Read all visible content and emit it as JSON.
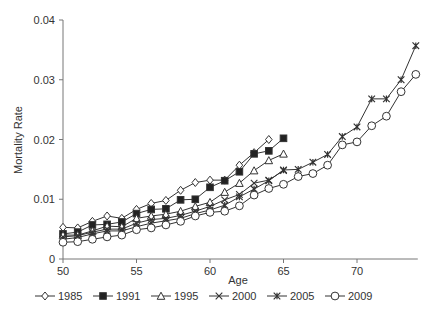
{
  "chart_data": {
    "type": "line",
    "title": "",
    "xlabel": "Age",
    "ylabel": "Mortality Rate",
    "xlim": [
      50,
      74
    ],
    "ylim": [
      0,
      0.04
    ],
    "x_ticks": [
      50,
      55,
      60,
      65,
      70
    ],
    "y_ticks": [
      0,
      0.01,
      0.02,
      0.03,
      0.04
    ],
    "y_tick_labels": [
      "0",
      "0.01",
      "0.02",
      "0.03",
      "0.04"
    ],
    "grid": false,
    "legend_position": "bottom",
    "series": [
      {
        "name": "1985",
        "marker": "diamond-open",
        "start_age": 50,
        "values": [
          0.0053,
          0.0052,
          0.0063,
          0.0072,
          0.0068,
          0.0083,
          0.0093,
          0.0098,
          0.0115,
          0.0128,
          0.0132,
          0.0132,
          0.0157,
          0.0178,
          0.02
        ]
      },
      {
        "name": "1991",
        "marker": "square-filled",
        "start_age": 50,
        "values": [
          0.0042,
          0.0045,
          0.0057,
          0.0058,
          0.0062,
          0.0076,
          0.0083,
          0.0084,
          0.0099,
          0.01,
          0.012,
          0.0131,
          0.0146,
          0.0176,
          0.0181,
          0.0202
        ]
      },
      {
        "name": "1995",
        "marker": "triangle-open",
        "start_age": 50,
        "values": [
          0.004,
          0.004,
          0.0047,
          0.0055,
          0.0054,
          0.0068,
          0.0072,
          0.0075,
          0.008,
          0.0088,
          0.0095,
          0.0112,
          0.0127,
          0.0148,
          0.0165,
          0.0176
        ]
      },
      {
        "name": "2000",
        "marker": "x",
        "start_age": 50,
        "values": [
          0.0037,
          0.0039,
          0.0045,
          0.005,
          0.005,
          0.006,
          0.0066,
          0.0068,
          0.0073,
          0.008,
          0.0088,
          0.0099,
          0.0108,
          0.0127,
          0.0132,
          0.0148
        ]
      },
      {
        "name": "2005",
        "marker": "star",
        "start_age": 50,
        "values": [
          0.0033,
          0.0036,
          0.0042,
          0.0047,
          0.0047,
          0.0054,
          0.006,
          0.0064,
          0.0068,
          0.0076,
          0.0082,
          0.009,
          0.0104,
          0.0117,
          0.0131,
          0.0149,
          0.015,
          0.0162,
          0.0175,
          0.0205,
          0.0221,
          0.0268,
          0.0268,
          0.03,
          0.0357
        ]
      },
      {
        "name": "2009",
        "marker": "circle-open",
        "start_age": 50,
        "values": [
          0.0028,
          0.0029,
          0.0033,
          0.0037,
          0.004,
          0.0049,
          0.0052,
          0.0057,
          0.0063,
          0.0072,
          0.0078,
          0.008,
          0.0089,
          0.0107,
          0.0118,
          0.0125,
          0.0138,
          0.0143,
          0.0157,
          0.0191,
          0.0196,
          0.0223,
          0.0239,
          0.028,
          0.0309
        ]
      }
    ]
  },
  "colors": {
    "line": "#333333",
    "axis": "#777777",
    "text": "#333333"
  }
}
